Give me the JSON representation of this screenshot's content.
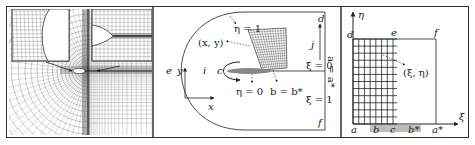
{
  "figure": {
    "panels": [
      {
        "id": "panel-a",
        "description": "Physical-domain C-type structured mesh around an airfoil with two magnified insets (leading edge and trailing edge)",
        "insets": [
          "leading-edge-zoom",
          "trailing-edge-zoom"
        ]
      },
      {
        "id": "panel-b",
        "description": "Physical domain (x, y) with boundaries labelled",
        "labels": {
          "eta1": "η = 1",
          "point_xy": "(x, y)",
          "d": "d",
          "j": "j",
          "xi0": "ξ = 0",
          "a_eq_astar": "a = a*",
          "xi1": "ξ = 1",
          "f": "f",
          "e": "e",
          "y_axis": "y",
          "x_axis": "x",
          "i": "i",
          "c": "c",
          "eta0": "η = 0",
          "b_eq_bstar": "b = b*"
        }
      },
      {
        "id": "panel-c",
        "description": "Computational domain (ξ, η) with uniform grid",
        "labels": {
          "eta_axis": "η",
          "xi_axis": "ξ",
          "d": "d",
          "e": "e",
          "f": "f",
          "point_xieta": "(ξ, η)",
          "a": "a",
          "b": "b",
          "c": "c",
          "bstar": "b*",
          "astar": "a*"
        }
      }
    ],
    "colors": {
      "line": "#222222",
      "mesh": "#555555",
      "airfoil_fill": "#888888",
      "wall_band": "#bdbdbd",
      "frame": "#333333"
    }
  }
}
